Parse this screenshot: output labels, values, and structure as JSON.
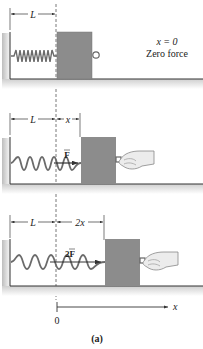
{
  "figure": {
    "caption": "(a)",
    "colors": {
      "block": "#8c8c8c",
      "spring": "#6b6b6b",
      "floor": "#3a3a3a",
      "shadow": "#d6d6d6",
      "hand": "#e8e8e8"
    },
    "panels": [
      {
        "id": "rest",
        "dim_L": "L",
        "state_label_1": "x = 0",
        "state_label_2": "Zero force"
      },
      {
        "id": "stretch-x",
        "dim_L": "L",
        "dim_x": "x",
        "force": "F"
      },
      {
        "id": "stretch-2x",
        "dim_L": "L",
        "dim_x": "2x",
        "force": "2F"
      }
    ],
    "axis": {
      "origin_label": "0",
      "axis_label": "x"
    }
  }
}
